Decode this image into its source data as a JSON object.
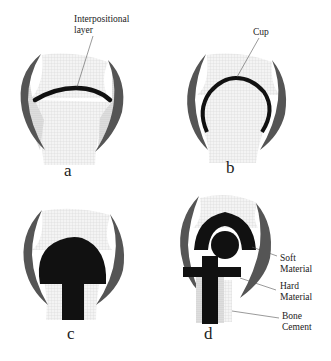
{
  "figure": {
    "panels": [
      {
        "id": "a",
        "label": "a",
        "annotation": "Interpositional\nlayer",
        "annotation_lines": [
          "Interpositional",
          "layer"
        ]
      },
      {
        "id": "b",
        "label": "b",
        "annotation_lines": [
          "Cup"
        ]
      },
      {
        "id": "c",
        "label": "c"
      },
      {
        "id": "d",
        "label": "d",
        "annotations": [
          {
            "lines": [
              "Soft",
              "Material"
            ]
          },
          {
            "lines": [
              "Hard",
              "Material"
            ]
          },
          {
            "lines": [
              "Bone",
              "Cement"
            ]
          }
        ]
      }
    ]
  },
  "colors": {
    "bone_grid": "#d9d9d9",
    "implant": "#111111",
    "capsule": "#555555",
    "stipple": "#bbbbbb"
  }
}
